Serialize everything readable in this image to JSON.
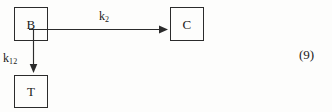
{
  "diagram": {
    "type": "compartmental-kinetic-model",
    "nodes": [
      {
        "id": "B",
        "label": "B"
      },
      {
        "id": "C",
        "label": "C"
      },
      {
        "id": "T",
        "label": "T"
      }
    ],
    "arrows": [
      {
        "id": "b-to-c",
        "from": "B",
        "to": "C",
        "direction": "right",
        "rate_label": "k",
        "rate_subscript": "2"
      },
      {
        "id": "b-to-t",
        "from": "B",
        "to": "T",
        "direction": "down",
        "rate_label": "k",
        "rate_subscript": "12"
      }
    ]
  },
  "labels": {
    "k2": {
      "base": "k",
      "sub": "2"
    },
    "k12": {
      "base": "k",
      "sub": "12"
    }
  },
  "equation": {
    "number": "(9)"
  },
  "colors": {
    "ink": "#2b2b2b",
    "text": "#1a1a1a",
    "background": "#fdfdfc"
  }
}
